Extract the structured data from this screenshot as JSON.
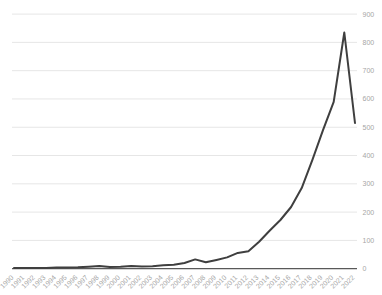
{
  "chart_data": {
    "type": "line",
    "title": "",
    "xlabel": "",
    "ylabel": "",
    "x": [
      1990,
      1991,
      1992,
      1993,
      1994,
      1995,
      1996,
      1997,
      1998,
      1999,
      2000,
      2001,
      2002,
      2003,
      2004,
      2005,
      2006,
      2007,
      2008,
      2009,
      2010,
      2011,
      2012,
      2013,
      2014,
      2015,
      2016,
      2017,
      2018,
      2019,
      2020,
      2021,
      2022
    ],
    "values": [
      3,
      3,
      3,
      3,
      4,
      4,
      5,
      7,
      10,
      6,
      7,
      10,
      8,
      9,
      12,
      14,
      20,
      33,
      23,
      31,
      40,
      56,
      62,
      95,
      135,
      172,
      218,
      285,
      385,
      490,
      590,
      835,
      515
    ],
    "ylim": [
      0,
      900
    ],
    "yticks": [
      0,
      100,
      200,
      300,
      400,
      500,
      600,
      700,
      800,
      900
    ],
    "y_axis_side": "right",
    "x_label_rotation": -45,
    "grid": "horizontal",
    "legend": "none",
    "colors": {
      "line": "#3f3f3f",
      "gridline": "#e6e6e6",
      "axis": "#595959",
      "tick_label": "#a6a6a6",
      "background": "#ffffff"
    }
  }
}
